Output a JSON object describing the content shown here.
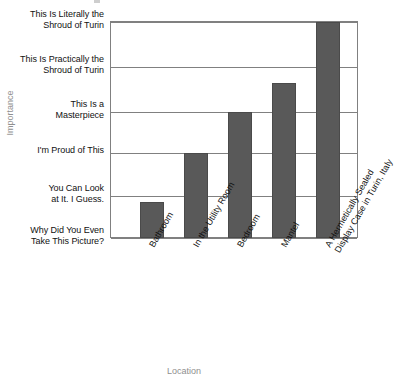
{
  "chart_data": {
    "type": "bar",
    "title": "",
    "xlabel": "Location",
    "ylabel": "Importance",
    "grid": true,
    "legend": "none",
    "orientation": "vertical",
    "bar_color": "#595959",
    "axis_color": "#808080",
    "axis_title_color": "#8f8f8f",
    "categories": [
      "Bathroom",
      "In the Utility Room",
      "Bedroom",
      "Mantel",
      "A Hermetically Sealed Display Case in Turin, Italy"
    ],
    "category_lines": [
      [
        "Bathroom"
      ],
      [
        "In the Utility Room"
      ],
      [
        "Bedroom"
      ],
      [
        "Mantel"
      ],
      [
        "A Hermetically Sealed",
        "Display Case in Turin, Italy"
      ]
    ],
    "ytick_labels": [
      "Why Did You Even Take This Picture?",
      "You Can Look at It. I Guess.",
      "I'm Proud of This",
      "This Is a Masterpiece",
      "This Is Practically the Shroud of Turin",
      "This Is Literally the Shroud of Turin"
    ],
    "ytick_lines": [
      [
        "Why Did You Even",
        "Take This Picture?"
      ],
      [
        "You Can Look",
        "at It. I Guess."
      ],
      [
        "I'm Proud of This"
      ],
      [
        "This Is a",
        "Masterpiece"
      ],
      [
        "This Is Practically the",
        "Shroud of Turin"
      ],
      [
        "This Is Literally the",
        "Shroud of Turin"
      ]
    ],
    "ylim": [
      0,
      5
    ],
    "values": [
      0.85,
      2,
      3,
      3.65,
      5
    ],
    "value_labels": [
      "You Can Look at It. I Guess.",
      "I'm Proud of This",
      "This Is a Masterpiece",
      "Between This Is a Masterpiece and This Is Practically the Shroud of Turin",
      "This Is Literally the Shroud of Turin"
    ]
  },
  "axes": {
    "y_title": "Importance",
    "x_title": "Location"
  }
}
